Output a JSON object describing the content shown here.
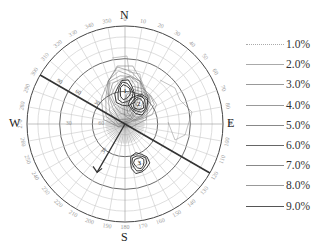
{
  "chart_data": {
    "type": "polar-contour",
    "title": "",
    "compass": {
      "north": "N",
      "south": "S",
      "east": "E",
      "west": "W"
    },
    "azimuth_ticks": [
      0,
      10,
      20,
      30,
      40,
      50,
      60,
      70,
      80,
      90,
      100,
      110,
      120,
      130,
      140,
      150,
      160,
      170,
      180,
      190,
      200,
      210,
      220,
      230,
      240,
      250,
      260,
      270,
      280,
      290,
      300,
      310,
      320,
      330,
      340,
      350
    ],
    "radial_ticks": [
      30,
      60,
      90
    ],
    "radial_range": [
      0,
      90
    ],
    "legend": {
      "position": "right",
      "entries": [
        "1.0%",
        "2.0%",
        "3.0%",
        "4.0%",
        "5.0%",
        "6.0%",
        "7.0%",
        "8.0%",
        "9.0%"
      ]
    },
    "contour_levels_percent": [
      1.0,
      2.0,
      3.0,
      4.0,
      5.0,
      6.0,
      7.0,
      8.0,
      9.0
    ],
    "density_peaks": [
      {
        "label": "1",
        "azimuth": 0,
        "dip": 60,
        "max_percent": 9.0
      },
      {
        "label": "2",
        "azimuth": 35,
        "dip": 68,
        "max_percent": 6.0
      },
      {
        "label": "3",
        "azimuth": 160,
        "dip": 52,
        "max_percent": 3.0
      }
    ],
    "great_circle": {
      "strike": 300,
      "description": "Bold straight line through center from NW (300°) to SE (120°)"
    },
    "arrow": {
      "from_azimuth": 0,
      "to_azimuth": 210,
      "plunge_label": "30",
      "description": "Arrow from center pointing SW"
    },
    "line_labels": [
      "90",
      "60",
      "30"
    ],
    "grid": true
  }
}
